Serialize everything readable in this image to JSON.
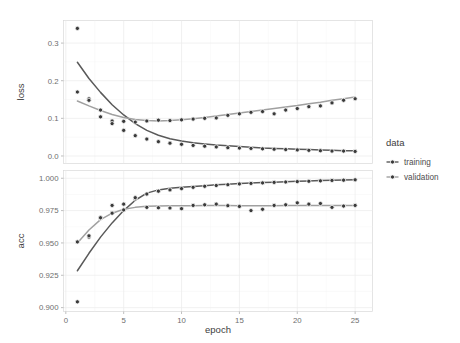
{
  "chart_data": {
    "type": "line",
    "title": "",
    "subtitle": "",
    "xlabel": "epoch",
    "ylabel": "",
    "facets": [
      {
        "name": "loss",
        "ylabel": "loss",
        "ylim": [
          -0.02,
          0.36
        ],
        "yticks": [
          0.0,
          0.1,
          0.2,
          0.3
        ],
        "yticklabels": [
          "0.0",
          "0.1",
          "0.2",
          "0.3"
        ],
        "series": [
          {
            "name": "training",
            "color": "#595959",
            "x": [
              1,
              2,
              3,
              4,
              5,
              6,
              7,
              8,
              9,
              10,
              11,
              12,
              13,
              14,
              15,
              16,
              17,
              18,
              19,
              20,
              21,
              22,
              23,
              24,
              25
            ],
            "values": [
              0.339,
              0.152,
              0.104,
              0.093,
              0.068,
              0.054,
              0.045,
              0.038,
              0.034,
              0.031,
              0.028,
              0.026,
              0.024,
              0.022,
              0.021,
              0.02,
              0.019,
              0.018,
              0.017,
              0.016,
              0.015,
              0.014,
              0.013,
              0.013,
              0.012
            ]
          },
          {
            "name": "validation",
            "color": "#a0a0a0",
            "x": [
              1,
              2,
              3,
              4,
              5,
              6,
              7,
              8,
              9,
              10,
              11,
              12,
              13,
              14,
              15,
              16,
              17,
              18,
              19,
              20,
              21,
              22,
              23,
              24,
              25
            ],
            "values": [
              0.17,
              0.148,
              0.122,
              0.086,
              0.092,
              0.09,
              0.093,
              0.095,
              0.094,
              0.096,
              0.098,
              0.1,
              0.101,
              0.108,
              0.112,
              0.116,
              0.118,
              0.112,
              0.122,
              0.126,
              0.131,
              0.133,
              0.141,
              0.148,
              0.152
            ]
          }
        ],
        "smooth": [
          {
            "name": "training",
            "color": "#595959",
            "points": [
              [
                1,
                0.249
              ],
              [
                2,
                0.206
              ],
              [
                3,
                0.169
              ],
              [
                4,
                0.136
              ],
              [
                5,
                0.109
              ],
              [
                6,
                0.086
              ],
              [
                7,
                0.068
              ],
              [
                8,
                0.055
              ],
              [
                9,
                0.046
              ],
              [
                10,
                0.04
              ],
              [
                11,
                0.035
              ],
              [
                12,
                0.032
              ],
              [
                13,
                0.029
              ],
              [
                14,
                0.027
              ],
              [
                15,
                0.025
              ],
              [
                16,
                0.023
              ],
              [
                17,
                0.021
              ],
              [
                18,
                0.02
              ],
              [
                19,
                0.019
              ],
              [
                20,
                0.018
              ],
              [
                21,
                0.017
              ],
              [
                22,
                0.016
              ],
              [
                23,
                0.015
              ],
              [
                24,
                0.014
              ],
              [
                25,
                0.014
              ]
            ]
          },
          {
            "name": "validation",
            "color": "#a0a0a0",
            "points": [
              [
                1,
                0.146
              ],
              [
                2,
                0.133
              ],
              [
                3,
                0.121
              ],
              [
                4,
                0.11
              ],
              [
                5,
                0.102
              ],
              [
                6,
                0.097
              ],
              [
                7,
                0.094
              ],
              [
                8,
                0.093
              ],
              [
                9,
                0.094
              ],
              [
                10,
                0.096
              ],
              [
                11,
                0.099
              ],
              [
                12,
                0.102
              ],
              [
                13,
                0.106
              ],
              [
                14,
                0.11
              ],
              [
                15,
                0.114
              ],
              [
                16,
                0.118
              ],
              [
                17,
                0.122
              ],
              [
                18,
                0.126
              ],
              [
                19,
                0.13
              ],
              [
                20,
                0.134
              ],
              [
                21,
                0.139
              ],
              [
                22,
                0.143
              ],
              [
                23,
                0.148
              ],
              [
                24,
                0.152
              ],
              [
                25,
                0.157
              ]
            ]
          }
        ]
      },
      {
        "name": "acc",
        "ylabel": "acc",
        "ylim": [
          0.897,
          1.006
        ],
        "yticks": [
          0.9,
          0.925,
          0.95,
          0.975,
          1.0
        ],
        "yticklabels": [
          "0.900",
          "0.925",
          "0.950",
          "0.975",
          "1.000"
        ],
        "series": [
          {
            "name": "training",
            "color": "#595959",
            "x": [
              1,
              2,
              3,
              4,
              5,
              6,
              7,
              8,
              9,
              10,
              11,
              12,
              13,
              14,
              15,
              16,
              17,
              18,
              19,
              20,
              21,
              22,
              23,
              24,
              25
            ],
            "values": [
              0.9045,
              0.9545,
              0.969,
              0.973,
              0.9755,
              0.984,
              0.9878,
              0.99,
              0.991,
              0.992,
              0.993,
              0.9938,
              0.9944,
              0.995,
              0.9956,
              0.996,
              0.9964,
              0.9968,
              0.9971,
              0.9974,
              0.9977,
              0.998,
              0.9983,
              0.9985,
              0.9988
            ]
          },
          {
            "name": "validation",
            "color": "#a0a0a0",
            "x": [
              1,
              2,
              3,
              4,
              5,
              6,
              7,
              8,
              9,
              10,
              11,
              12,
              13,
              14,
              15,
              16,
              17,
              18,
              19,
              20,
              21,
              22,
              23,
              24,
              25
            ],
            "values": [
              0.9508,
              0.9555,
              0.9695,
              0.979,
              0.98,
              0.985,
              0.9775,
              0.9772,
              0.977,
              0.9765,
              0.979,
              0.9795,
              0.98,
              0.9788,
              0.9782,
              0.975,
              0.976,
              0.979,
              0.9795,
              0.981,
              0.98,
              0.9805,
              0.9775,
              0.9785,
              0.979
            ]
          }
        ],
        "smooth": [
          {
            "name": "training",
            "color": "#595959",
            "points": [
              [
                1,
                0.9285
              ],
              [
                2,
                0.942
              ],
              [
                3,
                0.9545
              ],
              [
                4,
                0.9655
              ],
              [
                5,
                0.975
              ],
              [
                6,
                0.983
              ],
              [
                7,
                0.9885
              ],
              [
                8,
                0.991
              ],
              [
                9,
                0.9922
              ],
              [
                10,
                0.993
              ],
              [
                11,
                0.9937
              ],
              [
                12,
                0.9943
              ],
              [
                13,
                0.9949
              ],
              [
                14,
                0.9954
              ],
              [
                15,
                0.9959
              ],
              [
                16,
                0.9963
              ],
              [
                17,
                0.9967
              ],
              [
                18,
                0.997
              ],
              [
                19,
                0.9973
              ],
              [
                20,
                0.9976
              ],
              [
                21,
                0.9979
              ],
              [
                22,
                0.9982
              ],
              [
                23,
                0.9984
              ],
              [
                24,
                0.9986
              ],
              [
                25,
                0.9988
              ]
            ]
          },
          {
            "name": "validation",
            "color": "#a0a0a0",
            "points": [
              [
                1,
                0.95
              ],
              [
                2,
                0.96
              ],
              [
                3,
                0.968
              ],
              [
                4,
                0.973
              ],
              [
                5,
                0.976
              ],
              [
                6,
                0.9775
              ],
              [
                7,
                0.9783
              ],
              [
                8,
                0.9786
              ],
              [
                9,
                0.9787
              ],
              [
                10,
                0.9787
              ],
              [
                11,
                0.9788
              ],
              [
                12,
                0.9789
              ],
              [
                13,
                0.9789
              ],
              [
                14,
                0.9789
              ],
              [
                15,
                0.9788
              ],
              [
                16,
                0.9787
              ],
              [
                17,
                0.9787
              ],
              [
                18,
                0.9788
              ],
              [
                19,
                0.9789
              ],
              [
                20,
                0.979
              ],
              [
                21,
                0.979
              ],
              [
                22,
                0.979
              ],
              [
                23,
                0.9789
              ],
              [
                24,
                0.9789
              ],
              [
                25,
                0.9789
              ]
            ]
          }
        ]
      }
    ],
    "xlim": [
      -0.2,
      26.5
    ],
    "xticks": [
      0,
      5,
      10,
      15,
      20,
      25
    ],
    "xticklabels": [
      "0",
      "5",
      "10",
      "15",
      "20",
      "25"
    ],
    "grid": true,
    "legend": {
      "title": "data",
      "position": "right",
      "entries": [
        {
          "label": "training",
          "color": "#595959"
        },
        {
          "label": "validation",
          "color": "#a0a0a0"
        }
      ]
    }
  },
  "theme": {
    "background": "#ffffff",
    "panel_border": "#d9d9d9",
    "grid_major": "#ebebeb",
    "grid_minor": "#f4f4f4",
    "tick_color": "#a3a3a3",
    "text_color": "#4d4d4d"
  }
}
